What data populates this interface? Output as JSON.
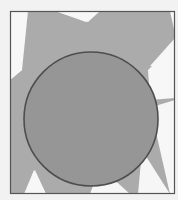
{
  "figure": {
    "frame": {
      "x": 10,
      "y": 11,
      "width": 165,
      "height": 183,
      "stroke": "#555555"
    },
    "background_color": "#f4f4f4",
    "rays_color": "#a9a9a9",
    "disc": {
      "cx": 91,
      "cy": 119,
      "r": 67,
      "fill": "#979797",
      "stroke": "#4e4e4e"
    }
  }
}
